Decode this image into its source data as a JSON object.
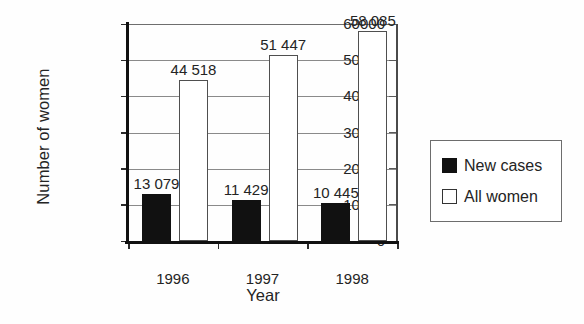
{
  "chart_data": {
    "type": "bar",
    "title": "",
    "xlabel": "Year",
    "ylabel": "Number of women",
    "categories": [
      "1996",
      "1997",
      "1998"
    ],
    "series": [
      {
        "name": "New cases",
        "color": "#111111",
        "values": [
          13079,
          11429,
          10445
        ],
        "labels": [
          "13 079",
          "11 429",
          "10 445"
        ]
      },
      {
        "name": "All women",
        "color": "#ffffff",
        "values": [
          44518,
          51447,
          58085
        ],
        "labels": [
          "44 518",
          "51 447",
          "58 085"
        ]
      }
    ],
    "ylim": [
      0,
      60000
    ],
    "yticks": [
      0,
      10000,
      20000,
      30000,
      40000,
      50000,
      60000
    ],
    "ytick_labels": [
      "0",
      "10000",
      "20000",
      "30000",
      "40000",
      "50000",
      "60000"
    ],
    "grid": true,
    "legend_position": "right"
  },
  "legend": {
    "entries": [
      {
        "label": "New cases",
        "swatch": "filled-square-icon"
      },
      {
        "label": "All women",
        "swatch": "hollow-square-icon"
      }
    ]
  }
}
